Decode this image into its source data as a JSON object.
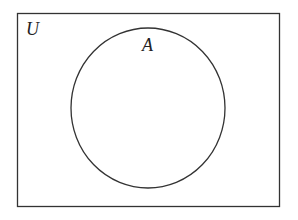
{
  "diagram": {
    "type": "venn",
    "universal_set": {
      "label": "U"
    },
    "sets": [
      {
        "label": "A"
      }
    ],
    "colors": {
      "stroke": "#333333",
      "background": "#ffffff"
    }
  }
}
